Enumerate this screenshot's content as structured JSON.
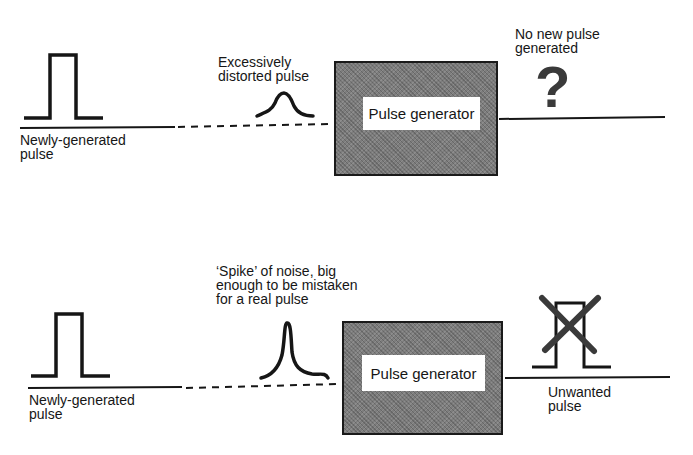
{
  "figure": {
    "type": "block-diagram",
    "colors": {
      "ink": "#161616",
      "box_fill": "#7d7d7d",
      "label_bg": "#ffffff"
    }
  },
  "scenario_top": {
    "input_pulse_label": "Newly-generated\npulse",
    "received_pulse_label": "Excessively\ndistorted pulse",
    "generator_label": "Pulse generator",
    "output_label": "No new pulse\ngenerated",
    "output_symbol": "?"
  },
  "scenario_bottom": {
    "input_pulse_label": "Newly-generated\npulse",
    "received_pulse_label": "‘Spike’ of noise, big\nenough to be mistaken\nfor a real pulse",
    "generator_label": "Pulse generator",
    "output_label": "Unwanted\npulse",
    "output_symbol": "crossed-out-pulse"
  }
}
